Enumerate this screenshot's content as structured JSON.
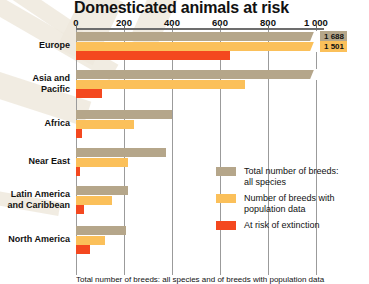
{
  "chart_data": {
    "type": "bar",
    "orientation": "horizontal",
    "title": "Domesticated animals at risk",
    "xlabel": "",
    "ylabel": "",
    "xlim": [
      0,
      1220
    ],
    "ticks": [
      0,
      200,
      400,
      600,
      800,
      1000
    ],
    "tick_labels": [
      "0",
      "200",
      "400",
      "600",
      "800",
      "1 000"
    ],
    "grid": true,
    "legend_position": "inside-right",
    "categories": [
      "Europe",
      "Asia and Pacific",
      "Africa",
      "Near East",
      "Latin America and Caribbean",
      "North America"
    ],
    "series": [
      {
        "name": "Total number of breeds: all species",
        "color": "#b5a68a",
        "values": [
          1688,
          1000,
          400,
          375,
          217,
          210
        ]
      },
      {
        "name": "Number of breeds with population data",
        "color": "#fbc05a",
        "values": [
          1501,
          705,
          242,
          218,
          150,
          120
        ]
      },
      {
        "name": "At risk of extinction",
        "color": "#f4481f",
        "values": [
          640,
          110,
          25,
          18,
          33,
          60
        ]
      }
    ],
    "value_labels": [
      {
        "series": "Total number of breeds: all species",
        "category": "Europe",
        "text": "1 688"
      },
      {
        "series": "Number of breeds with population data",
        "category": "Europe",
        "text": "1 501"
      }
    ],
    "axis_breaks": [
      {
        "category": "Europe",
        "series": "Total number of breeds: all species"
      },
      {
        "category": "Europe",
        "series": "Number of breeds with population data"
      }
    ],
    "footnote": "Total number of breeds: all species and of breeds with population data"
  },
  "legend": {
    "items": [
      {
        "label_line1": "Total number of breeds:",
        "label_line2": "all species",
        "color": "#b5a68a"
      },
      {
        "label_line1": "Number of breeds with",
        "label_line2": "population data",
        "color": "#fbc05a"
      },
      {
        "label_line1": "At risk of extinction",
        "label_line2": "",
        "color": "#f4481f"
      }
    ]
  },
  "colors": {
    "total": "#b5a68a",
    "population": "#fbc05a",
    "risk": "#f4481f",
    "grid": "#9b9b9b",
    "axis": "#6d6d6d",
    "text": "#111111",
    "background": "#ffffff"
  }
}
